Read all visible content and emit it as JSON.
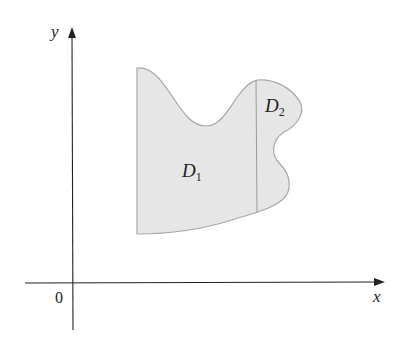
{
  "figure": {
    "axes": {
      "x_label": "x",
      "y_label": "y",
      "origin_label": "0"
    },
    "regions": [
      {
        "name": "D",
        "subscript": "1"
      },
      {
        "name": "D",
        "subscript": "2"
      }
    ],
    "colors": {
      "region_fill": "#e6e6e6",
      "region_stroke": "#a8a8a8",
      "axis": "#222222"
    }
  }
}
